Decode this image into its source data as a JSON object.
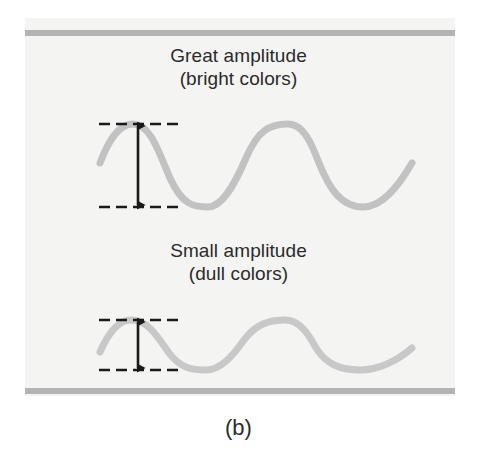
{
  "figure": {
    "caption": "(b)",
    "background_color": "#ffffff",
    "panel_color": "#f4f4f3",
    "rule_color": "#b3b3b3",
    "text_color": "#2b2b2b"
  },
  "top_rule": {
    "name": "top-boundary-rule"
  },
  "bottom_rule": {
    "name": "bottom-boundary-rule"
  },
  "sections": {
    "great": {
      "title": "Great amplitude",
      "subtitle": "(bright colors)",
      "wave_color": "#c2c2c2",
      "amplitude_label": "great"
    },
    "small": {
      "title": "Small amplitude",
      "subtitle": "(dull colors)",
      "wave_color": "#c8c8c8",
      "amplitude_label": "small"
    }
  },
  "chart_data": {
    "type": "line",
    "title": "(b)",
    "subtitle": "Wave amplitude comparison: great amplitude (bright colors) vs small amplitude (dull colors)",
    "xlabel": "",
    "ylabel": "",
    "grid": false,
    "legend_position": "none",
    "axis_ranges": {
      "xlim": [
        100,
        412
      ],
      "ylim_top": [
        124,
        207
      ],
      "ylim_bottom": [
        320,
        370
      ]
    },
    "annotations": [
      {
        "text": "Great amplitude",
        "x": 238,
        "y": 53
      },
      {
        "text": "(bright colors)",
        "x": 238,
        "y": 76
      },
      {
        "text": "Small amplitude",
        "x": 238,
        "y": 248
      },
      {
        "text": "(dull colors)",
        "x": 238,
        "y": 271
      },
      {
        "text": "(b)",
        "x": 238,
        "y": 432
      }
    ],
    "series": [
      {
        "name": "Great amplitude",
        "color": "#c2c2c2",
        "peak_y": 124,
        "trough_y": 207,
        "midline_y": 165.5,
        "amplitude_px": 41.5,
        "peak_to_trough_px": 83,
        "wavelength_px": 155,
        "x_start": 100,
        "x_end": 412,
        "dashed_line_top_y": 124,
        "dashed_line_bottom_y": 207,
        "dashed_line_x_start": 99,
        "dashed_line_x_end": 184,
        "arrow_x": 138,
        "arrow_y_top": 124,
        "arrow_y_bottom": 207
      },
      {
        "name": "Small amplitude",
        "color": "#c8c8c8",
        "peak_y": 320,
        "trough_y": 370,
        "midline_y": 345,
        "amplitude_px": 25,
        "peak_to_trough_px": 50,
        "wavelength_px": 155,
        "x_start": 100,
        "x_end": 412,
        "dashed_line_top_y": 320,
        "dashed_line_bottom_y": 370,
        "dashed_line_x_start": 99,
        "dashed_line_x_end": 184,
        "arrow_x": 138,
        "arrow_y_top": 320,
        "arrow_y_bottom": 370
      }
    ]
  }
}
